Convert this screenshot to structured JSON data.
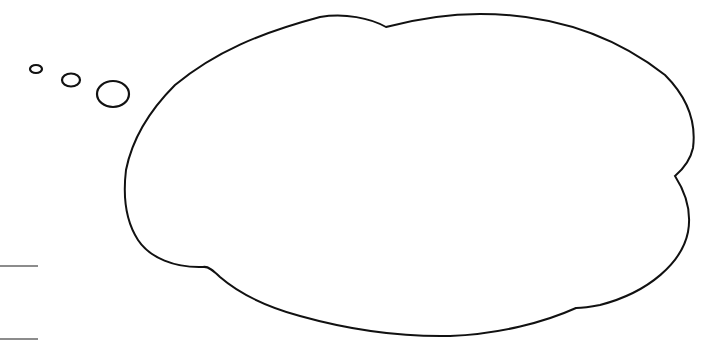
{
  "canvas": {
    "width": 720,
    "height": 346,
    "background": "#ffffff"
  },
  "stroke": {
    "color": "#111111",
    "guide_color": "#666666"
  },
  "bubble": {
    "label": "",
    "kind": "thought-bubble",
    "trail_circles": [
      {
        "cx": 36,
        "cy": 69,
        "rx": 6,
        "ry": 4
      },
      {
        "cx": 71,
        "cy": 80,
        "rx": 9,
        "ry": 6.5
      },
      {
        "cx": 113,
        "cy": 94,
        "rx": 16,
        "ry": 13
      }
    ]
  },
  "guide_lines": [
    {
      "y": 266,
      "x1": 0,
      "x2": 38
    },
    {
      "y": 339,
      "x1": 0,
      "x2": 38
    }
  ]
}
